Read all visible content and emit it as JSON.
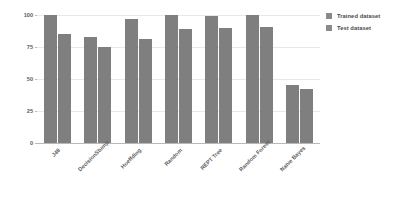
{
  "chart_data": {
    "type": "bar",
    "title": "",
    "xlabel": "",
    "ylabel": "",
    "ylim": [
      0,
      100
    ],
    "yticks": [
      0,
      25,
      50,
      75,
      100
    ],
    "grid": true,
    "legend_position": "right",
    "bar_color": "#7f7f7f",
    "categories": [
      "J48",
      "DecisionStump",
      "Hoeffding",
      "Random",
      "REPT Tree",
      "Random Forest",
      "Naïve Bayes"
    ],
    "series": [
      {
        "name": "Trained dataset",
        "color": "#7f7f7f",
        "values": [
          100,
          83,
          97,
          100,
          99,
          100,
          45
        ]
      },
      {
        "name": "Test dataset",
        "color": "#7f7f7f",
        "values": [
          85,
          75,
          81,
          89,
          90,
          91,
          42
        ]
      }
    ]
  },
  "legend": {
    "items": [
      {
        "label": "Trained dataset"
      },
      {
        "label": "Test dataset"
      }
    ]
  }
}
